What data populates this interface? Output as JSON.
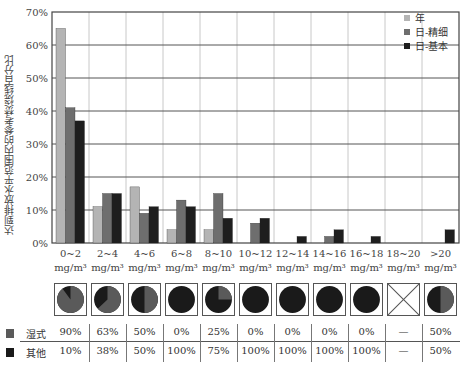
{
  "chart_data": {
    "type": "bar",
    "title": "",
    "xlabel": "",
    "ylabel": "达到排放水平范围内的参考焚烧线百分比",
    "ylim": [
      0,
      70
    ],
    "yticks": [
      "0%",
      "10%",
      "20%",
      "30%",
      "40%",
      "50%",
      "60%",
      "70%"
    ],
    "grid": true,
    "legend_position": "upper right",
    "categories": [
      "0~2",
      "2~4",
      "4~6",
      "6~8",
      "8~10",
      "10~12",
      "12~14",
      "14~16",
      "16~18",
      "18~20",
      ">20"
    ],
    "category_unit": "mg/m³",
    "series": [
      {
        "name": "年",
        "color": "#b4b4b4",
        "values": [
          65,
          11,
          17,
          4,
          4,
          0,
          0,
          0,
          0,
          0,
          0
        ]
      },
      {
        "name": "日-精细",
        "color": "#6e6e6e",
        "values": [
          41,
          15,
          9,
          13,
          15,
          6,
          0,
          2,
          0,
          0,
          0
        ]
      },
      {
        "name": "日-基本",
        "color": "#1e1e1e",
        "values": [
          37,
          15,
          11,
          11,
          7.5,
          7.5,
          2,
          4,
          2,
          0,
          4
        ]
      }
    ],
    "pies": {
      "series": [
        {
          "name": "湿式",
          "color": "#5a5a5a",
          "values": [
            "90%",
            "63%",
            "50%",
            "0%",
            "25%",
            "0%",
            "0%",
            "0%",
            "0%",
            "—",
            "50%"
          ],
          "fractions": [
            0.9,
            0.63,
            0.5,
            0,
            0.25,
            0,
            0,
            0,
            0,
            null,
            0.5
          ]
        },
        {
          "name": "其他",
          "color": "#1a1a1a",
          "values": [
            "10%",
            "38%",
            "50%",
            "100%",
            "75%",
            "100%",
            "100%",
            "100%",
            "100%",
            "—",
            "50%"
          ]
        }
      ]
    }
  }
}
